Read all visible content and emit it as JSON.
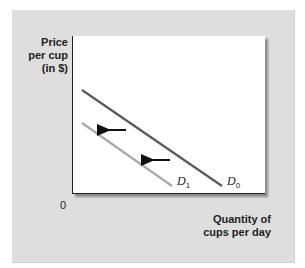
{
  "chart_data": {
    "type": "line",
    "title": "",
    "ylabel": "Price per cup (in $)",
    "xlabel": "Quantity of cups per day",
    "origin_label": "0",
    "grid": false,
    "legend": "none (direct curve labels)",
    "series": [
      {
        "name": "D0",
        "label_main": "D",
        "label_sub": "0",
        "color": "#5a5a5a",
        "description": "original demand curve",
        "points": [
          [
            82,
            90
          ],
          [
            222,
            186
          ]
        ]
      },
      {
        "name": "D1",
        "label_main": "D",
        "label_sub": "1",
        "color": "#a9a9a9",
        "description": "shifted demand curve (leftward)",
        "points": [
          [
            82,
            123
          ],
          [
            172,
            186
          ]
        ]
      }
    ],
    "annotations": [
      {
        "type": "arrow",
        "direction": "left",
        "from": [
          126,
          130
        ],
        "to": [
          103,
          130
        ]
      },
      {
        "type": "arrow",
        "direction": "left",
        "from": [
          170,
          160
        ],
        "to": [
          147,
          160
        ]
      }
    ],
    "ticks": {
      "x": [],
      "y": []
    }
  },
  "labels": {
    "y_axis": "Price\nper cup\n(in $)",
    "x_axis": "Quantity of\ncups per day",
    "origin": "0"
  }
}
